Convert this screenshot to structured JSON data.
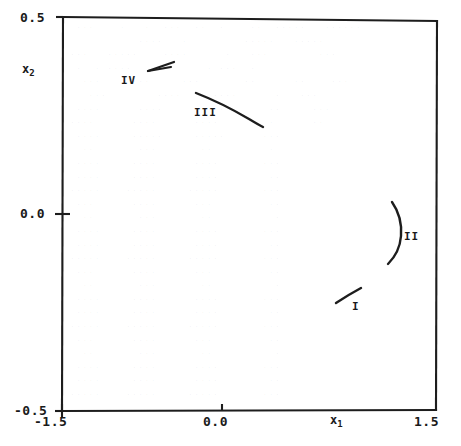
{
  "chart_data": {
    "type": "line",
    "title": "",
    "xlabel": "x_1",
    "ylabel": "x_2",
    "xlim": [
      -1.5,
      1.5
    ],
    "ylim": [
      -0.5,
      0.5
    ],
    "grid": false,
    "legend_position": "inline-annotations",
    "xticks": [
      -1.5,
      0.0,
      1.5
    ],
    "xticklabels": [
      "-1.5",
      "0.0",
      "1.5"
    ],
    "yticks": [
      -0.5,
      0.0,
      0.5
    ],
    "yticklabels": [
      "-0.5",
      "0.0",
      "0.5"
    ],
    "annotations": [
      "I",
      "II",
      "III",
      "IV"
    ],
    "series": [
      {
        "name": "I",
        "label": "I",
        "comment": "short straight segment, lower right quadrant",
        "x": [
          0.69,
          0.89,
          1.09
        ],
        "y": [
          -0.236,
          -0.203,
          -0.174
        ]
      },
      {
        "name": "II",
        "label": "II",
        "comment": "arc bowing to the right, right of centre",
        "x": [
          1.14,
          1.23,
          1.27,
          1.24,
          1.11
        ],
        "y": [
          0.031,
          0.005,
          -0.03,
          -0.069,
          -0.126
        ]
      },
      {
        "name": "III",
        "label": "III",
        "comment": "long descending segment, slight downward curvature",
        "x": [
          -0.43,
          -0.25,
          -0.07,
          0.11
        ],
        "y": [
          0.307,
          0.28,
          0.245,
          0.22
        ]
      },
      {
        "name": "IV",
        "label": "IV",
        "comment": "narrow wedge / doubled-back sliver, upper left",
        "x": [
          -0.94,
          -0.72,
          -0.94
        ],
        "y": [
          0.392,
          0.376,
          0.383
        ]
      }
    ]
  },
  "axes": {
    "x_axis_label": "x",
    "x_axis_sub": "1",
    "y_axis_label": "x",
    "y_axis_sub": "2",
    "x_min_label": "-1.5",
    "x_mid_label": "0.0",
    "x_max_label": "1.5",
    "y_min_label": "-0.5",
    "y_mid_label": "0.0",
    "y_max_label": "0.5"
  },
  "curve_labels": {
    "one": "I",
    "two": "II",
    "three": "III",
    "four": "IV"
  },
  "colors": {
    "ink": "#1a1a1a",
    "background": "#ffffff"
  },
  "bleed_text": [
    "  ...    .   .  ...  ..  .    ..  .....   ......",
    "            ....   .         .....   .....",
    " ...   .....    ....      .   ...        ...",
    "  .  . ....            . ...  .",
    "   ...     ...     ...       ..      ..    ...",
    "    ...        ....     ....      .   ...",
    "  ....      ....      ....       ..     ...",
    " ....      ....      ....        .      ..",
    "  ....     .....     .....      ...",
    "   ..       ...       ..         .",
    "  ....     ....      ....       ...",
    "  ....     ....      ....        ..",
    " .....    .....     .....       ...",
    "  ...      ....      ...         ..",
    "   ..       ...       ..          .",
    "  ....     ....      ....       ...",
    "  ....     ....      ....        ..",
    " .....    .....     .....       ...",
    "  ...      ....      ...         ..",
    "   ..       ...       ..          .",
    "  ....     ....      ....       ...",
    "  ....     ....      ....        ..",
    " .....    .....     .....       ...",
    "  ...      ....      ...         ..",
    "   ..       ...       ..          .",
    "  ....     ....      ....       ...",
    "  ....     ....      ....        ..",
    " .....    .....     .....       ..."
  ]
}
